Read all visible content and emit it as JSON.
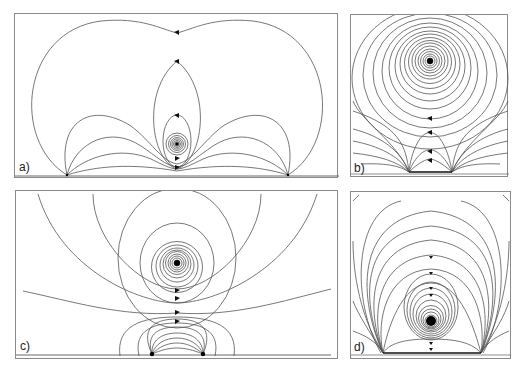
{
  "figure": {
    "panels": [
      {
        "id": "a",
        "label": "a)",
        "description": "Streamlines: two sources on wall, vortex/dipole singularity above midpoint with closed loops",
        "singularity": {
          "x": 176,
          "y": 143
        },
        "wall_sources": [
          {
            "x": 66,
            "y": 174
          },
          {
            "x": 287,
            "y": 174
          }
        ],
        "arrow_count": 6
      },
      {
        "id": "b",
        "label": "b)",
        "description": "Streamlines: concentric circles around a vortex high above two close wall sources",
        "singularity": {
          "x": 429,
          "y": 60
        },
        "wall_sources": [
          {
            "x": 408,
            "y": 171
          },
          {
            "x": 451,
            "y": 171
          }
        ],
        "arrow_count": 4
      },
      {
        "id": "c",
        "label": "c)",
        "description": "Streamlines: vortex above, dipole-like closed loops between two wall sources below, separatrix between",
        "singularity": {
          "x": 176,
          "y": 262
        },
        "wall_sources": [
          {
            "x": 151,
            "y": 353
          },
          {
            "x": 202,
            "y": 353
          }
        ],
        "arrow_count": 4
      },
      {
        "id": "d",
        "label": "d)",
        "description": "Streamlines: vortex close to wall between two wall sources with nested loops",
        "singularity": {
          "x": 430,
          "y": 320
        },
        "wall_sources": [
          {
            "x": 382,
            "y": 352
          },
          {
            "x": 480,
            "y": 352
          }
        ],
        "arrow_count": 6
      }
    ]
  }
}
